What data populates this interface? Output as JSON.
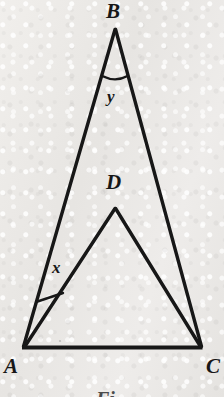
{
  "figure": {
    "kind": "geometry-diagram",
    "background_color": "#ebe9e6",
    "ink_color": "#171717",
    "stroke_width": 3,
    "labels": {
      "B": "B",
      "D": "D",
      "A": "A",
      "C": "C",
      "angle_x": "x",
      "angle_y": "y"
    },
    "caption_fragment": "Fi",
    "points": {
      "A": {
        "x": 22,
        "y": 348
      },
      "B": {
        "x": 115,
        "y": 28
      },
      "C": {
        "x": 202,
        "y": 348
      },
      "D": {
        "x": 115,
        "y": 207
      }
    },
    "segments": [
      {
        "name": "AB",
        "from": "A",
        "to": "B"
      },
      {
        "name": "BC",
        "from": "B",
        "to": "C"
      },
      {
        "name": "AC",
        "from": "A",
        "to": "C"
      },
      {
        "name": "AD",
        "from": "A",
        "to": "D"
      },
      {
        "name": "DC",
        "from": "D",
        "to": "C"
      }
    ],
    "angle_marks": [
      {
        "name": "angle-y-at-B",
        "vertex": "B",
        "style": "arc",
        "label": "y"
      },
      {
        "name": "angle-x-at-A",
        "vertex": "A",
        "style": "straight-bar",
        "label": "x",
        "between": [
          "AB",
          "AD"
        ]
      }
    ]
  }
}
